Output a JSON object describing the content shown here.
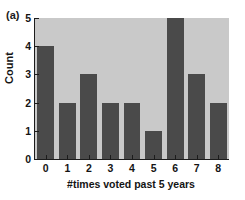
{
  "panel": {
    "label": "(a)"
  },
  "chart_data": {
    "type": "bar",
    "title": "",
    "subtitle": "",
    "xlabel": "#times voted past 5 years",
    "ylabel": "Count",
    "categories": [
      "0",
      "1",
      "2",
      "3",
      "4",
      "5",
      "6",
      "7",
      "8"
    ],
    "values": [
      4,
      2,
      3,
      2,
      2,
      1,
      5,
      3,
      2
    ],
    "xtick_labels": [
      "0",
      "1",
      "2",
      "3",
      "4",
      "5",
      "6",
      "7",
      "8"
    ],
    "ytick_labels": [
      "0",
      "1",
      "2",
      "3",
      "4",
      "5"
    ],
    "ytick_values": [
      0,
      1,
      2,
      3,
      4,
      5
    ],
    "ylim": [
      0,
      5
    ],
    "xlim": [
      -0.5,
      8.5
    ],
    "grid": false,
    "legend": false,
    "legend_position": "none",
    "annotations": [
      "(a)"
    ],
    "colors": {
      "bar": "#4a4a4a",
      "plot_background": "#c9c9c9",
      "figure_background": "#ffffff",
      "axis": "#1c1c1c",
      "text": "#141414"
    }
  }
}
